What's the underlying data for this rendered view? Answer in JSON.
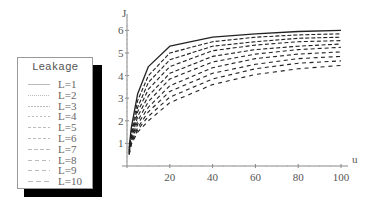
{
  "chart_data": {
    "type": "line",
    "title": "",
    "xlabel": "u",
    "ylabel": "J",
    "xlim": [
      0,
      100
    ],
    "ylim": [
      0,
      6.3
    ],
    "x_ticks": [
      20,
      40,
      60,
      80,
      100
    ],
    "y_ticks": [
      1,
      2,
      3,
      4,
      5,
      6
    ],
    "grid": false,
    "legend": {
      "title": "Leakage",
      "position": "left"
    },
    "x": [
      1,
      2,
      5,
      10,
      20,
      40,
      60,
      80,
      100
    ],
    "series": [
      {
        "name": "L=1",
        "values": [
          0.8,
          1.7,
          3.2,
          4.4,
          5.3,
          5.7,
          5.85,
          5.95,
          6.0
        ]
      },
      {
        "name": "L=2",
        "values": [
          0.7,
          1.5,
          2.9,
          4.0,
          5.0,
          5.5,
          5.7,
          5.8,
          5.85
        ]
      },
      {
        "name": "L=3",
        "values": [
          0.7,
          1.4,
          2.6,
          3.7,
          4.7,
          5.3,
          5.5,
          5.65,
          5.7
        ]
      },
      {
        "name": "L=4",
        "values": [
          0.65,
          1.3,
          2.4,
          3.4,
          4.4,
          5.1,
          5.35,
          5.5,
          5.55
        ]
      },
      {
        "name": "L=5",
        "values": [
          0.6,
          1.2,
          2.2,
          3.1,
          4.1,
          4.85,
          5.15,
          5.3,
          5.4
        ]
      },
      {
        "name": "L=6",
        "values": [
          0.6,
          1.15,
          2.0,
          2.85,
          3.85,
          4.6,
          4.95,
          5.15,
          5.25
        ]
      },
      {
        "name": "L=7",
        "values": [
          0.55,
          1.1,
          1.85,
          2.6,
          3.55,
          4.35,
          4.75,
          4.95,
          5.05
        ]
      },
      {
        "name": "L=8",
        "values": [
          0.55,
          1.05,
          1.7,
          2.4,
          3.3,
          4.1,
          4.5,
          4.75,
          4.85
        ]
      },
      {
        "name": "L=9",
        "values": [
          0.5,
          1.0,
          1.6,
          2.2,
          3.05,
          3.85,
          4.3,
          4.55,
          4.65
        ]
      },
      {
        "name": "L=10",
        "values": [
          0.5,
          0.95,
          1.5,
          2.0,
          2.8,
          3.6,
          4.05,
          4.3,
          4.45
        ]
      }
    ]
  },
  "legend": {
    "title": "Leakage",
    "items": [
      {
        "label": "L=1",
        "dash": "none"
      },
      {
        "label": "L=2",
        "dash": "1,1"
      },
      {
        "label": "L=3",
        "dash": "2,1"
      },
      {
        "label": "L=4",
        "dash": "2,2"
      },
      {
        "label": "L=5",
        "dash": "3,2"
      },
      {
        "label": "L=6",
        "dash": "3,2"
      },
      {
        "label": "L=7",
        "dash": "4,2"
      },
      {
        "label": "L=8",
        "dash": "4,3"
      },
      {
        "label": "L=9",
        "dash": "4,3"
      },
      {
        "label": "L=10",
        "dash": "5,3"
      }
    ]
  },
  "colors": {
    "curve": "#222222",
    "axis": "#888888",
    "text": "#555555",
    "shadow": "#000000"
  }
}
